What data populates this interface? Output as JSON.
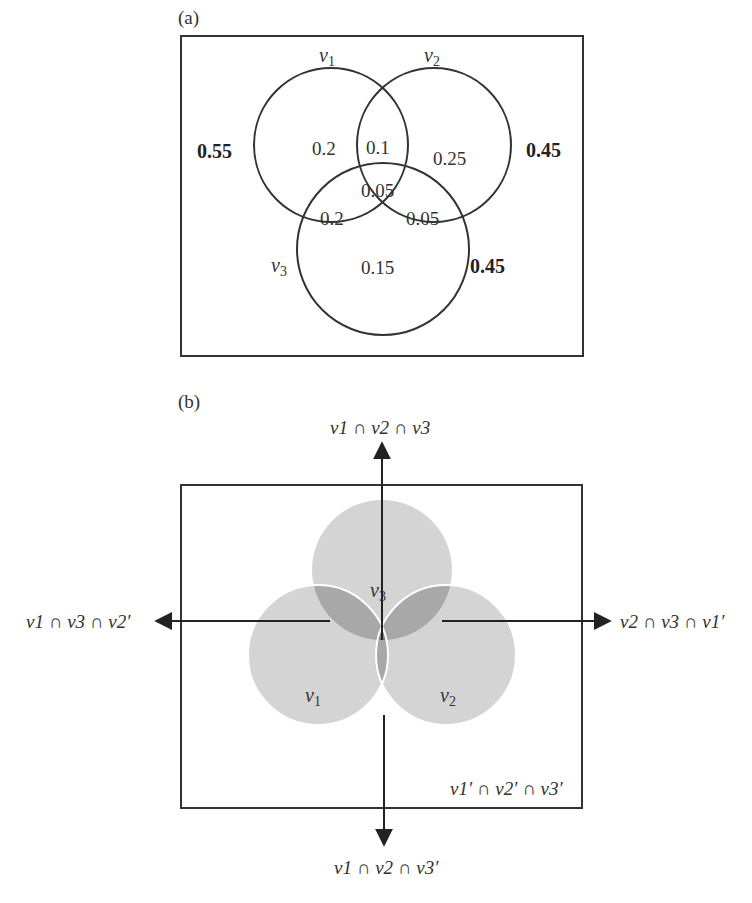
{
  "panel_a": {
    "label": "(a)",
    "sets": {
      "v1": {
        "name": "v",
        "sub": "1",
        "total": "0.55"
      },
      "v2": {
        "name": "v",
        "sub": "2",
        "total": "0.45"
      },
      "v3": {
        "name": "v",
        "sub": "3",
        "total": "0.45"
      }
    },
    "regions": {
      "v1_only": "0.2",
      "v1_v2": "0.1",
      "v2_only": "0.25",
      "v1_v2_v3": "0.05",
      "v1_v3": "0.2",
      "v2_v3": "0.05",
      "v3_only": "0.15"
    }
  },
  "panel_b": {
    "label": "(b)",
    "circle_labels": {
      "v1": "1",
      "v2": "2",
      "v3": "3",
      "base": "v"
    },
    "arrows": {
      "top": "v1 ∩ v2 ∩ v3",
      "left": "v1 ∩ v3 ∩ v2′",
      "right": "v2 ∩ v3 ∩ v1′",
      "bottom": "v1 ∩ v2 ∩ v3′",
      "complement": "v1′ ∩ v2′ ∩ v3′"
    },
    "colors": {
      "single": "#d4d4d4",
      "double": "#a8a8a8",
      "triple": "#7e7e7e"
    }
  }
}
